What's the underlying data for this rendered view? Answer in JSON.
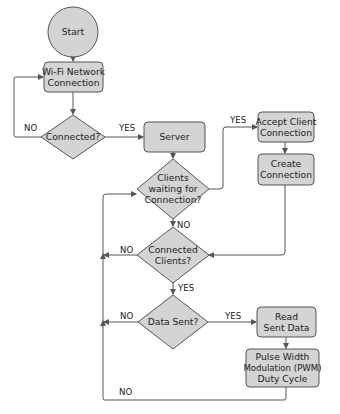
{
  "diagram": {
    "type": "flowchart",
    "colors": {
      "node_fill": "#d4d4d4",
      "stroke": "#555555",
      "text": "#222222",
      "background": "#ffffff"
    },
    "nodes": {
      "start": {
        "shape": "circle",
        "lines": [
          "Start"
        ]
      },
      "wifi": {
        "shape": "rounded-rect",
        "lines": [
          "Wi-Fi Network",
          "Connection"
        ]
      },
      "connected": {
        "shape": "diamond",
        "lines": [
          "Connected?"
        ]
      },
      "server": {
        "shape": "rounded-rect",
        "lines": [
          "Server"
        ]
      },
      "clients_waiting": {
        "shape": "diamond",
        "lines": [
          "Clients",
          "waiting for",
          "Connection?"
        ]
      },
      "accept_client": {
        "shape": "rounded-rect",
        "lines": [
          "Accept Client",
          "Connection"
        ]
      },
      "create_connection": {
        "shape": "rounded-rect",
        "lines": [
          "Create",
          "Connection"
        ]
      },
      "connected_clients": {
        "shape": "diamond",
        "lines": [
          "Connected",
          "Clients?"
        ]
      },
      "data_sent": {
        "shape": "diamond",
        "lines": [
          "Data Sent?"
        ]
      },
      "read_data": {
        "shape": "rounded-rect",
        "lines": [
          "Read",
          "Sent Data"
        ]
      },
      "pwm": {
        "shape": "rounded-rect",
        "lines": [
          "Pulse Width",
          "Modulation (PWM)",
          "Duty Cycle"
        ]
      }
    },
    "edge_labels": {
      "connected_no": "NO",
      "connected_yes": "YES",
      "clients_waiting_yes": "YES",
      "clients_waiting_no": "NO",
      "connected_clients_no": "NO",
      "connected_clients_yes": "YES",
      "data_sent_no": "NO",
      "data_sent_yes": "YES",
      "pwm_loop_no": "NO"
    },
    "edges": [
      {
        "from": "start",
        "to": "wifi"
      },
      {
        "from": "wifi",
        "to": "connected"
      },
      {
        "from": "connected",
        "to": "wifi",
        "label": "NO"
      },
      {
        "from": "connected",
        "to": "server",
        "label": "YES"
      },
      {
        "from": "server",
        "to": "clients_waiting"
      },
      {
        "from": "clients_waiting",
        "to": "accept_client",
        "label": "YES"
      },
      {
        "from": "accept_client",
        "to": "create_connection"
      },
      {
        "from": "create_connection",
        "to": "connected_clients"
      },
      {
        "from": "clients_waiting",
        "to": "connected_clients",
        "label": "NO"
      },
      {
        "from": "connected_clients",
        "to": "clients_waiting",
        "label": "NO"
      },
      {
        "from": "connected_clients",
        "to": "data_sent",
        "label": "YES"
      },
      {
        "from": "data_sent",
        "to": "clients_waiting",
        "label": "NO"
      },
      {
        "from": "data_sent",
        "to": "read_data",
        "label": "YES"
      },
      {
        "from": "read_data",
        "to": "pwm"
      },
      {
        "from": "pwm",
        "to": "clients_waiting",
        "label": "NO"
      }
    ]
  }
}
